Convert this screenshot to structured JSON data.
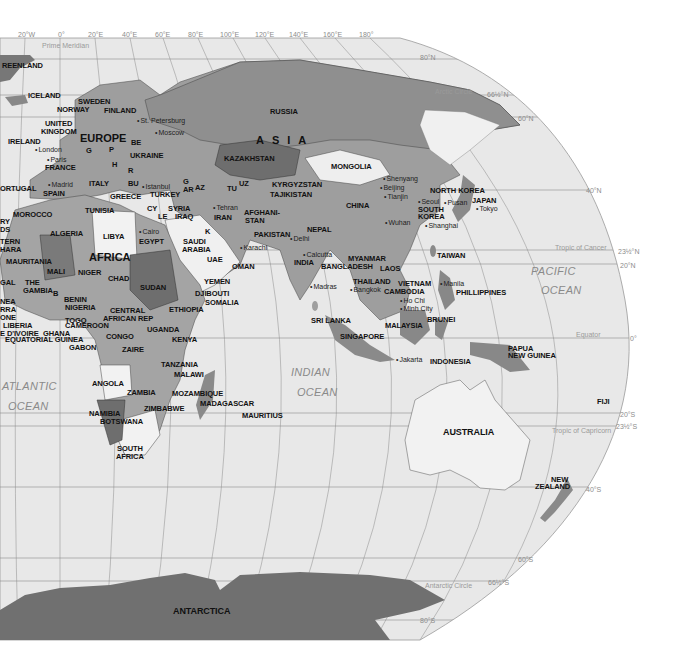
{
  "map": {
    "type": "world-political-map",
    "style": "grayscale",
    "colors": {
      "ocean": "#e8e8e8",
      "land_light": "#f2f2f2",
      "land_mid": "#9e9e9e",
      "land_dark": "#6e6e6e",
      "antarctica": "#707070",
      "graticule": "#8a8a8a",
      "background": "#ffffff"
    },
    "longitude_labels": [
      "20°W",
      "0°",
      "20°E",
      "40°E",
      "60°E",
      "80°E",
      "100°E",
      "120°E",
      "140°E",
      "160°E",
      "180°"
    ],
    "latitude_labels": [
      "80°N",
      "66½°N",
      "60°N",
      "40°N",
      "23½°N",
      "20°N",
      "0°",
      "20°S",
      "23½°S",
      "40°S",
      "60°S",
      "66½°S",
      "80°S"
    ],
    "reference_lines": {
      "prime_meridian": "Prime Meridian",
      "arctic_circle": "Arctic Circle",
      "tropic_of_cancer": "Tropic of Cancer",
      "equator": "Equator",
      "tropic_of_capricorn": "Tropic of Capricorn",
      "antarctic_circle": "Antarctic Circle"
    },
    "regions": {
      "europe": "EUROPE",
      "asia": "ASIA",
      "africa": "AFRICA",
      "australia": "AUSTRALIA",
      "antarctica": "ANTARCTICA"
    },
    "oceans": {
      "atlantic_1": "ATLANTIC",
      "atlantic_2": "OCEAN",
      "indian_1": "INDIAN",
      "indian_2": "OCEAN",
      "pacific_1": "PACIFIC",
      "pacific_2": "OCEAN"
    },
    "countries": {
      "greenland": "REENLAND",
      "iceland": "ICELAND",
      "sweden": "SWEDEN",
      "norway": "NORWAY",
      "finland": "FINLAND",
      "united_kingdom_1": "UNITED",
      "united_kingdom_2": "KINGDOM",
      "ireland": "IRELAND",
      "france": "FRANCE",
      "portugal": "ORTUGAL",
      "spain": "SPAIN",
      "italy": "ITALY",
      "greece": "GREECE",
      "ukraine": "UKRAINE",
      "belarus": "BE",
      "poland": "P",
      "germany": "G",
      "romania": "R",
      "bulgaria": "BU",
      "hungary": "H",
      "turkey": "TURKEY",
      "cyprus": "CY",
      "lebanon": "LE",
      "syria": "SYRIA",
      "iraq": "IRAQ",
      "iran": "IRAN",
      "armenia": "AR",
      "azerbaijan": "AZ",
      "georgia": "G",
      "kuwait": "K",
      "turkmenistan": "TU",
      "uzbekistan": "UZ",
      "kazakhstan": "KAZAKHSTAN",
      "kyrgyzstan": "KYRGYZSTAN",
      "tajikistan": "TAJIKISTAN",
      "afghanistan_1": "AFGHANI-",
      "afghanistan_2": "STAN",
      "pakistan": "PAKISTAN",
      "russia": "RUSSIA",
      "mongolia": "MONGOLIA",
      "china": "CHINA",
      "north_korea": "NORTH KOREA",
      "south_korea_1": "SOUTH",
      "south_korea_2": "KOREA",
      "japan": "JAPAN",
      "taiwan": "TAIWAN",
      "nepal": "NEPAL",
      "india": "INDIA",
      "bangladesh": "BANGLADESH",
      "myanmar": "MYANMAR",
      "laos": "LAOS",
      "thailand": "THAILAND",
      "vietnam": "VIETNAM",
      "cambodia": "CAMBODIA",
      "philippines": "PHILLIPPINES",
      "sri_lanka": "SRI LANKA",
      "malaysia": "MALAYSIA",
      "brunei": "BRUNEI",
      "singapore": "SINGAPORE",
      "indonesia": "INDONESIA",
      "papua_new_guinea_1": "PAPUA",
      "papua_new_guinea_2": "NEW GUINEA",
      "fiji": "FIJI",
      "new_zealand_1": "NEW",
      "new_zealand_2": "ZEALAND",
      "saudi_arabia_1": "SAUDI",
      "saudi_arabia_2": "ARABIA",
      "uae": "UAE",
      "oman": "OMAN",
      "yemen": "YEMEN",
      "djibouti": "DJIBOUTI",
      "somalia": "SOMALIA",
      "ethiopia": "ETHIOPIA",
      "kenya": "KENYA",
      "uganda": "UGANDA",
      "tanzania": "TANZANIA",
      "malawi": "MALAWI",
      "mozambique": "MOZAMBIQUE",
      "madagascar": "MADAGASCAR",
      "mauritius": "MAURITIUS",
      "zambia": "ZAMBIA",
      "zimbabwe": "ZIMBABWE",
      "botswana": "BOTSWANA",
      "namibia": "NAMIBIA",
      "south_africa_1": "SOUTH",
      "south_africa_2": "AFRICA",
      "angola": "ANGOLA",
      "zaire": "ZAIRE",
      "congo": "CONGO",
      "gabon": "GABON",
      "cameroon": "CAMEROON",
      "equatorial_guinea": "EQUATORIAL GUINEA",
      "central_african_rep_1": "CENTRAL",
      "central_african_rep_2": "AFRICAN REP",
      "sudan": "SUDAN",
      "egypt": "EGYPT",
      "libya": "LIBYA",
      "chad": "CHAD",
      "niger": "NIGER",
      "nigeria": "NIGERIA",
      "benin": "BENIN",
      "togo": "TOGO",
      "ghana": "GHANA",
      "burkina": "B",
      "cote_divoire": "E D'IVOIRE",
      "liberia": "LIBERIA",
      "sierra_leone_1": "RRA",
      "sierra_leone_2": "ONE",
      "guinea": "NEA",
      "gambia_1": "THE",
      "gambia_2": "GAMBIA",
      "senegal": "GAL",
      "mali": "MALI",
      "mauritania": "MAURITANIA",
      "western_sahara_1": "TERN",
      "western_sahara_2": "HARA",
      "algeria": "ALGERIA",
      "morocco": "MOROCCO",
      "tunisia": "TUNISIA",
      "canary_1": "RY",
      "canary_2": "DS"
    },
    "cities": {
      "st_petersburg": "St. Petersburg",
      "moscow": "Moscow",
      "london": "London",
      "paris": "Paris",
      "madrid": "Madrid",
      "istanbul": "Istanbul",
      "cairo": "Cairo",
      "tehran": "Tehran",
      "karachi": "Karachi",
      "delhi": "Delhi",
      "calcutta": "Calcutta",
      "madras": "Madras",
      "bangkok": "Bangkok",
      "ho_chi_minh_1": "Ho Chi",
      "ho_chi_minh_2": "Minh City",
      "manila": "Manila",
      "jakarta": "Jakarta",
      "shenyang": "Shenyang",
      "beijing": "Beijing",
      "tianjin": "Tianjin",
      "seoul": "Seoul",
      "pusan": "Pusan",
      "tokyo": "Tokyo",
      "wuhan": "Wuhan",
      "shanghai": "Shanghai"
    }
  }
}
